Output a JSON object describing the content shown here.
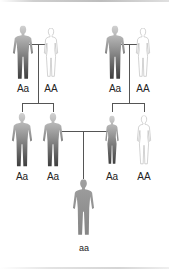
{
  "diagram": {
    "type": "pedigree",
    "generations": [
      {
        "couples": [
          {
            "male": {
              "genotype": "Aa",
              "shade": "dark"
            },
            "female": {
              "genotype": "AA",
              "shade": "light"
            }
          },
          {
            "male": {
              "genotype": "Aa",
              "shade": "dark"
            },
            "female": {
              "genotype": "AA",
              "shade": "light"
            }
          }
        ]
      },
      {
        "children": [
          {
            "genotype": "Aa",
            "sex": "male",
            "shade": "dark"
          },
          {
            "genotype": "Aa",
            "sex": "male",
            "shade": "dark"
          },
          {
            "genotype": "Aa",
            "sex": "female",
            "shade": "dark"
          },
          {
            "genotype": "AA",
            "sex": "female",
            "shade": "light"
          }
        ]
      },
      {
        "children": [
          {
            "genotype": "aa",
            "sex": "male",
            "shade": "medium"
          }
        ]
      }
    ],
    "colors": {
      "line": "#555555",
      "dark_top": "#c8c8c8",
      "dark_bottom": "#3a3a3a",
      "light_fill": "#ffffff",
      "light_stroke": "#bdbdbd",
      "medium": "#8f8f8f"
    }
  },
  "labels": {
    "g1_left_male": "Aa",
    "g1_left_female": "AA",
    "g1_right_male": "Aa",
    "g1_right_female": "AA",
    "g2_1": "Aa",
    "g2_2": "Aa",
    "g2_3": "Aa",
    "g2_4": "AA",
    "g3_1": "aa"
  }
}
